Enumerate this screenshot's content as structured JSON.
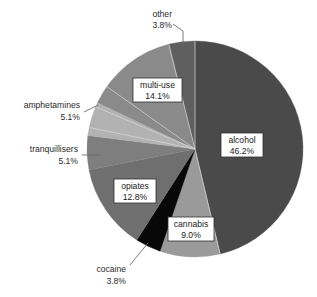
{
  "chart_data": {
    "type": "pie",
    "title": "",
    "subtitle": "",
    "xlabel": "",
    "ylabel": "",
    "legend_position": "none",
    "grid": false,
    "value_unit": "percent",
    "total": 99.9,
    "start_angle_deg": 0,
    "direction": "clockwise",
    "categories": [
      "alcohol",
      "cannabis",
      "cocaine",
      "opiates",
      "tranquillisers",
      "amphetamines",
      "multi-use",
      "other"
    ],
    "values": [
      46.2,
      9.0,
      3.8,
      12.8,
      5.1,
      5.1,
      14.1,
      3.8
    ],
    "value_labels": [
      "46.2%",
      "9.0%",
      "3.8%",
      "12.8%",
      "5.1%",
      "5.1%",
      "14.1%",
      "3.8%"
    ],
    "colors": [
      "#4a4a4a",
      "#9a9a9a",
      "#080808",
      "#6f6f6f",
      "#7e7e7e",
      "#b2b2b2",
      "#8a8a8a",
      "#5f5f5f"
    ],
    "slices": [
      {
        "name": "alcohol",
        "value": 46.2,
        "value_label": "46.2%",
        "color": "#4a4a4a",
        "label_style": "boxed-inside"
      },
      {
        "name": "cannabis",
        "value": 9.0,
        "value_label": "9.0%",
        "color": "#9a9a9a",
        "label_style": "boxed-inside"
      },
      {
        "name": "cocaine",
        "value": 3.8,
        "value_label": "3.8%",
        "color": "#080808",
        "label_style": "leader-outside"
      },
      {
        "name": "opiates",
        "value": 12.8,
        "value_label": "12.8%",
        "color": "#6f6f6f",
        "label_style": "boxed-inside"
      },
      {
        "name": "tranquillisers",
        "value": 5.1,
        "value_label": "5.1%",
        "color": "#7e7e7e",
        "label_style": "leader-outside"
      },
      {
        "name": "amphetamines",
        "value": 5.1,
        "value_label": "5.1%",
        "color": "#b2b2b2",
        "label_style": "leader-outside"
      },
      {
        "name": "multi-use",
        "value": 14.1,
        "value_label": "14.1%",
        "color": "#8a8a8a",
        "label_style": "boxed-inside"
      },
      {
        "name": "other",
        "value": 3.8,
        "value_label": "3.8%",
        "color": "#5f5f5f",
        "label_style": "leader-outside"
      }
    ]
  },
  "labels": {
    "other": {
      "name": "other",
      "percent": "3.8%"
    },
    "multi_use": {
      "name": "multi-use",
      "percent": "14.1%"
    },
    "amphetamines": {
      "name": "amphetamines",
      "percent": "5.1%"
    },
    "tranquillisers": {
      "name": "tranquillisers",
      "percent": "5.1%"
    },
    "opiates": {
      "name": "opiates",
      "percent": "12.8%"
    },
    "cocaine": {
      "name": "cocaine",
      "percent": "3.8%"
    },
    "cannabis": {
      "name": "cannabis",
      "percent": "9.0%"
    },
    "alcohol": {
      "name": "alcohol",
      "percent": "46.2%"
    }
  }
}
